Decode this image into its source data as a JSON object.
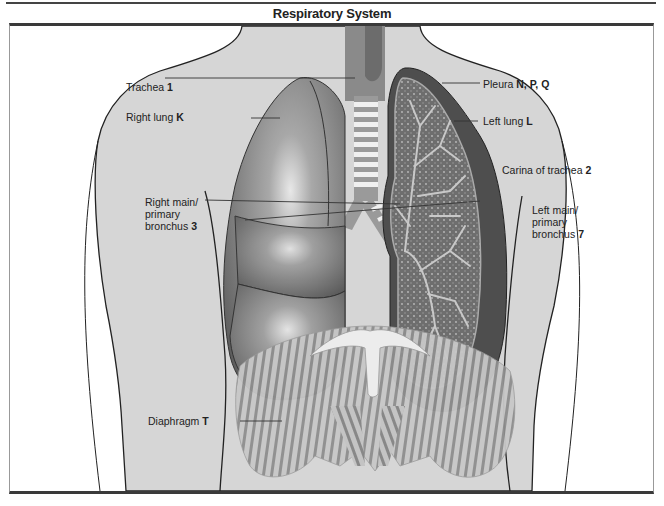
{
  "header": {
    "title": "Respiratory System"
  },
  "diagram": {
    "labels": [
      {
        "id": "trachea",
        "text": "Trachea",
        "code": "1",
        "side": "left"
      },
      {
        "id": "right-lung",
        "text": "Right lung",
        "code": "K",
        "side": "left"
      },
      {
        "id": "right-main-bronchus",
        "text_lines": [
          "Right main/",
          "primary",
          "bronchus"
        ],
        "code": "3",
        "side": "left"
      },
      {
        "id": "diaphragm",
        "text": "Diaphragm",
        "code": "T",
        "side": "left"
      },
      {
        "id": "pleura",
        "text": "Pleura",
        "code": "N, P, Q",
        "side": "right"
      },
      {
        "id": "left-lung",
        "text": "Left lung",
        "code": "L",
        "side": "right"
      },
      {
        "id": "carina",
        "text": "Carina of trachea",
        "code": "2",
        "side": "right"
      },
      {
        "id": "left-main-bronchus",
        "text_lines": [
          "Left main/",
          "primary",
          "bronchus"
        ],
        "code": "7",
        "side": "right"
      }
    ],
    "colors": {
      "skin": "#d4d4d4",
      "lung_dark": "#6a6a6a",
      "lung_light": "#bdbdbd",
      "cartilage": "#f2f2f2",
      "trachea": "#9a9a9a",
      "diaphragm": "#a8a8a8",
      "outline": "#222222"
    }
  }
}
